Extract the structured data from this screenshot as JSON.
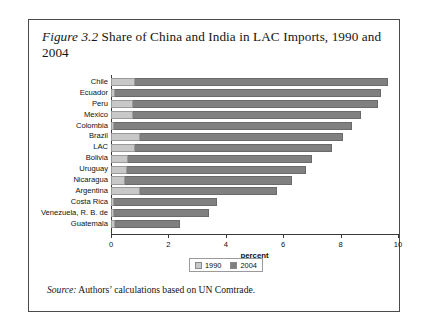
{
  "figure": {
    "number_label": "Figure 3.2",
    "title_text": " Share of China and India in LAC Imports, 1990 and 2004",
    "source_label": "Source:",
    "source_text": " Authors’ calculations based on UN Comtrade."
  },
  "legend": {
    "position": "bottom-center",
    "entries": [
      {
        "label": "1990",
        "color": "#c8c8c8"
      },
      {
        "label": "2004",
        "color": "#808080"
      }
    ]
  },
  "axis": {
    "xlabel": "percent",
    "ticks": [
      "0",
      "2",
      "4",
      "6",
      "8",
      "10"
    ]
  },
  "chart_data": {
    "type": "bar",
    "orientation": "horizontal",
    "stacked": true,
    "title": "Figure 3.2 Share of China and India in LAC Imports, 1990 and 2004",
    "xlabel": "percent",
    "ylabel": "",
    "xlim": [
      0,
      10
    ],
    "xticks": [
      0,
      2,
      4,
      6,
      8,
      10
    ],
    "grid": false,
    "legend_position": "bottom-center",
    "categories": [
      "Chile",
      "Ecuador",
      "Peru",
      "Mexico",
      "Colombia",
      "Brazil",
      "LAC",
      "Bolivia",
      "Uruguay",
      "Nicaragua",
      "Argentina",
      "Costa Rica",
      "Venezuela, R. B. de",
      "Guatemala"
    ],
    "series": [
      {
        "name": "1990",
        "color": "#c8c8c8",
        "values": [
          0.85,
          0.15,
          0.75,
          0.75,
          0.1,
          1.0,
          0.85,
          0.6,
          0.55,
          0.5,
          1.0,
          0.1,
          0.1,
          0.15
        ]
      },
      {
        "name": "2004",
        "color": "#808080",
        "values": [
          8.8,
          9.25,
          8.55,
          7.95,
          8.3,
          7.1,
          6.85,
          6.4,
          6.25,
          5.8,
          4.8,
          3.6,
          3.3,
          2.25
        ]
      }
    ],
    "totals": [
      9.65,
      9.4,
      9.3,
      8.7,
      8.4,
      8.1,
      7.7,
      7.0,
      6.8,
      6.3,
      5.8,
      3.7,
      3.4,
      2.4
    ],
    "units": "percent"
  }
}
